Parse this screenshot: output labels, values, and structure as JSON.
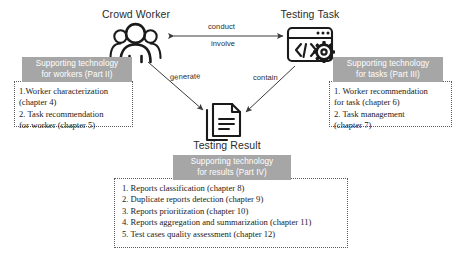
{
  "diagram": {
    "nodes": {
      "crowd_worker": {
        "label": "Crowd Worker",
        "icon": "people-group-icon"
      },
      "testing_task": {
        "label": "Testing Task",
        "icon": "code-window-gear-icon"
      },
      "testing_result": {
        "label": "Testing Result",
        "icon": "documents-icon"
      }
    },
    "edges": {
      "conduct": "conduct",
      "involve": "involve",
      "generate": "generate",
      "contain": "contain"
    },
    "panels": {
      "workers": {
        "header_line1": "Supporting technology",
        "header_line2": "for workers (Part II)",
        "items": [
          "1.Worker characterization",
          "(chapter 4)",
          "2. Task recommendation",
          "for worker (chapter 5)"
        ]
      },
      "tasks": {
        "header_line1": "Supporting technology",
        "header_line2": "for tasks (Part III)",
        "items": [
          "1. Worker recommendation",
          "for task (chapter 6)",
          "2. Task management",
          " (chapter 7)"
        ]
      },
      "results": {
        "header_line1": "Supporting technology",
        "header_line2": "for results (Part IV)",
        "items": [
          "1. Reports classification (chapter 8)",
          "2. Duplicate reports detection (chapter 9)",
          "3. Reports prioritization (chapter 10)",
          "4. Reports aggregation and summarization (chapter 11)",
          "5. Test cases quality assessment (chapter 12)"
        ]
      }
    },
    "colors": {
      "header_bg": "#a6a6a6",
      "header_text": "#ffffff",
      "border": "#5b5b5b",
      "ink": "#1a1a1a",
      "page_bg": "#ffffff"
    }
  }
}
